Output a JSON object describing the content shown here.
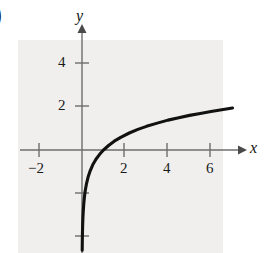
{
  "figure": {
    "partial_label": ")",
    "background_color": "#f0efee",
    "curve_color": "#111111",
    "axis_color": "#6e6e6e"
  },
  "axes": {
    "x_name": "x",
    "y_name": "y"
  },
  "x_ticks": [
    {
      "value": -2,
      "label": "−2",
      "px": 39
    },
    {
      "value": 2,
      "label": "2",
      "px": 124
    },
    {
      "value": 4,
      "label": "4",
      "px": 167
    },
    {
      "value": 6,
      "label": "6",
      "px": 210
    }
  ],
  "y_ticks": [
    {
      "value": 4,
      "label": "4",
      "px": 63
    },
    {
      "value": 2,
      "label": "2",
      "px": 106
    },
    {
      "value": -2,
      "label": "",
      "px": 193
    },
    {
      "value": -4,
      "label": "",
      "px": 236
    }
  ],
  "chart_data": {
    "type": "line",
    "title": "",
    "xlabel": "x",
    "ylabel": "y",
    "xlim": [
      -2.9,
      7.5
    ],
    "ylim": [
      -4.7,
      4.8
    ],
    "grid": false,
    "legend": null,
    "function": "y = ln(x)",
    "x_ticks": [
      -2,
      2,
      4,
      6
    ],
    "y_ticks": [
      4,
      2,
      -2,
      -4
    ],
    "x_tick_labels": [
      "−2",
      "2",
      "4",
      "6"
    ],
    "y_tick_labels": [
      "4",
      "2",
      "",
      ""
    ],
    "series": [
      {
        "name": "y = ln(x)",
        "x": [
          0.0095,
          0.012,
          0.016,
          0.022,
          0.03,
          0.042,
          0.058,
          0.08,
          0.11,
          0.15,
          0.21,
          0.28,
          0.38,
          0.5,
          0.65,
          0.82,
          1.0,
          1.25,
          1.5,
          1.8,
          2.2,
          2.6,
          3.0,
          3.5,
          4.0,
          4.5,
          5.0,
          5.5,
          6.0,
          6.5,
          7.0
        ],
        "y": [
          -4.66,
          -4.42,
          -4.14,
          -3.82,
          -3.51,
          -3.17,
          -2.85,
          -2.53,
          -2.21,
          -1.9,
          -1.56,
          -1.27,
          -0.97,
          -0.69,
          -0.43,
          -0.2,
          0.0,
          0.22,
          0.41,
          0.59,
          0.79,
          0.96,
          1.1,
          1.25,
          1.39,
          1.5,
          1.61,
          1.7,
          1.79,
          1.87,
          1.95
        ]
      }
    ]
  }
}
